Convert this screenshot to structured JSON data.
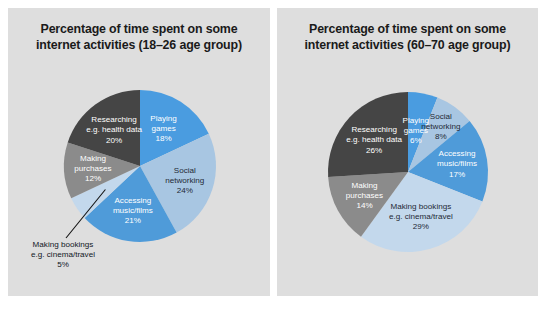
{
  "figure": {
    "background_color": "#ffffff",
    "panel_color": "#dedede"
  },
  "palette": {
    "playing_games": "#4a9ce0",
    "social_networking": "#a8c6e2",
    "accessing_music_films": "#4f9bd9",
    "making_bookings": "#c3d8ec",
    "making_purchases": "#8b8b8b",
    "researching": "#454545"
  },
  "panels": [
    {
      "id": "left",
      "title_line1": "Percentage of time spent on some",
      "title_line2": "internet activities (18–26 age group)"
    },
    {
      "id": "right",
      "title_line1": "Percentage of time spent on some",
      "title_line2": "internet activities (60–70 age group)"
    }
  ],
  "chart_data": [
    {
      "type": "pie",
      "title": "Percentage of time spent on some internet activities (18–26 age group)",
      "age_group": "18–26",
      "unit": "percent",
      "start_angle_deg": 0,
      "direction": "clockwise",
      "categories": [
        "Playing games",
        "Social networking",
        "Accessing music/films",
        "Making bookings e.g. cinema/travel",
        "Making purchases",
        "Researching e.g. health data"
      ],
      "values": [
        18,
        24,
        21,
        5,
        12,
        20
      ],
      "labels": [
        {
          "line1": "Playing",
          "line2": "games",
          "line3": "18%",
          "value": 18,
          "color": "#4a9ce0",
          "text": "light",
          "callout": false
        },
        {
          "line1": "Social",
          "line2": "networking",
          "line3": "24%",
          "value": 24,
          "color": "#a8c6e2",
          "text": "dark",
          "callout": false
        },
        {
          "line1": "Accessing",
          "line2": "music/films",
          "line3": "21%",
          "value": 21,
          "color": "#4f9bd9",
          "text": "light",
          "callout": false
        },
        {
          "line1": "Making bookings",
          "line2": "e.g. cinema/travel",
          "line3": "5%",
          "value": 5,
          "color": "#c3d8ec",
          "text": "dark",
          "callout": true
        },
        {
          "line1": "Making",
          "line2": "purchases",
          "line3": "12%",
          "value": 12,
          "color": "#8b8b8b",
          "text": "light",
          "callout": false
        },
        {
          "line1": "Researching",
          "line2": "e.g. health data",
          "line3": "20%",
          "value": 20,
          "color": "#454545",
          "text": "light",
          "callout": false
        }
      ]
    },
    {
      "type": "pie",
      "title": "Percentage of time spent on some internet activities (60–70 age group)",
      "age_group": "60–70",
      "unit": "percent",
      "start_angle_deg": 0,
      "direction": "clockwise",
      "categories": [
        "Playing games",
        "Social networking",
        "Accessing music/films",
        "Making bookings e.g. cinema/travel",
        "Making purchases",
        "Researching e.g. health data"
      ],
      "values": [
        6,
        8,
        17,
        29,
        14,
        26
      ],
      "labels": [
        {
          "line1": "Playing",
          "line2": "games",
          "line3": "6%",
          "value": 6,
          "color": "#4a9ce0",
          "text": "light",
          "callout": false
        },
        {
          "line1": "Social",
          "line2": "networking",
          "line3": "8%",
          "value": 8,
          "color": "#a8c6e2",
          "text": "dark",
          "callout": false
        },
        {
          "line1": "Accessing",
          "line2": "music/films",
          "line3": "17%",
          "value": 17,
          "color": "#4f9bd9",
          "text": "light",
          "callout": false
        },
        {
          "line1": "Making bookings",
          "line2": "e.g. cinema/travel",
          "line3": "29%",
          "value": 29,
          "color": "#c3d8ec",
          "text": "dark",
          "callout": false
        },
        {
          "line1": "Making",
          "line2": "purchases",
          "line3": "14%",
          "value": 14,
          "color": "#8b8b8b",
          "text": "light",
          "callout": false
        },
        {
          "line1": "Researching",
          "line2": "e.g. health data",
          "line3": "26%",
          "value": 26,
          "color": "#454545",
          "text": "light",
          "callout": false
        }
      ]
    }
  ]
}
